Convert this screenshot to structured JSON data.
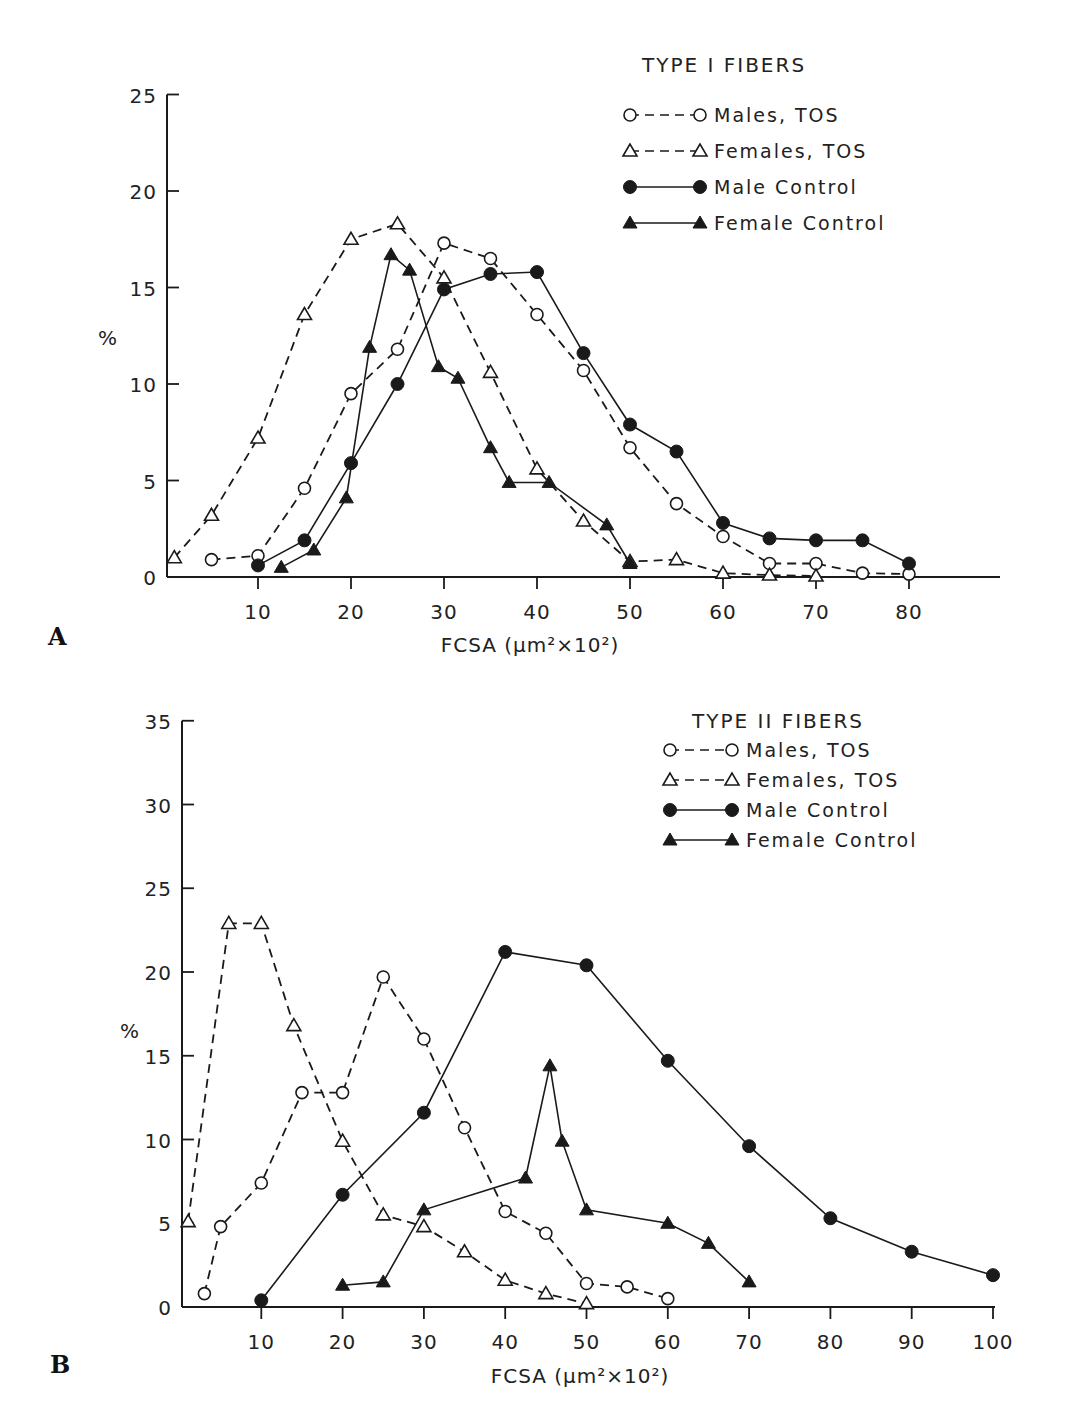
{
  "panels": [
    {
      "letter": "A"
    },
    {
      "letter": "B"
    }
  ],
  "chart_data": [
    {
      "type": "line",
      "panel": "A",
      "title": "TYPE I FIBERS",
      "xlabel": "FCSA (μm²×10²)",
      "ylabel": "%",
      "xlim": [
        0,
        90
      ],
      "ylim": [
        0,
        25
      ],
      "xticks": [
        10,
        20,
        30,
        40,
        50,
        60,
        70,
        80
      ],
      "yticks": [
        0,
        5,
        10,
        15,
        20,
        25
      ],
      "grid": false,
      "legend_position": "upper right",
      "series": [
        {
          "name": "Males, TOS",
          "marker": "open-circle",
          "line": "dashed",
          "x": [
            5,
            10,
            15,
            20,
            25,
            30,
            35,
            40,
            45,
            50,
            55,
            60,
            65,
            70,
            75,
            80
          ],
          "y": [
            0.9,
            1.1,
            4.6,
            9.5,
            11.8,
            17.3,
            16.5,
            13.6,
            10.7,
            6.7,
            3.8,
            2.1,
            0.7,
            0.7,
            0.2,
            0.15
          ]
        },
        {
          "name": "Females, TOS",
          "marker": "open-triangle",
          "line": "dashed",
          "x": [
            1,
            5,
            10,
            15,
            20,
            25,
            30,
            35,
            40,
            45,
            50,
            55,
            60,
            65,
            70
          ],
          "y": [
            1.0,
            3.2,
            7.2,
            13.6,
            17.5,
            18.3,
            15.5,
            10.6,
            5.6,
            2.9,
            0.8,
            0.9,
            0.2,
            0.1,
            0.05
          ]
        },
        {
          "name": "Male Control",
          "marker": "filled-circle",
          "line": "solid",
          "x": [
            10,
            15,
            20,
            25,
            30,
            35,
            40,
            45,
            50,
            55,
            60,
            65,
            70,
            75,
            80
          ],
          "y": [
            0.6,
            1.9,
            5.9,
            10.0,
            14.9,
            15.7,
            15.8,
            11.6,
            7.9,
            6.5,
            2.8,
            2.0,
            1.9,
            1.9,
            0.7
          ]
        },
        {
          "name": "Female Control",
          "marker": "filled-triangle",
          "line": "solid",
          "x": [
            12.5,
            16,
            19.5,
            22,
            24.3,
            26.3,
            29.4,
            31.5,
            35,
            37,
            41.3,
            47.5,
            50
          ],
          "y": [
            0.5,
            1.4,
            4.1,
            11.9,
            16.7,
            15.9,
            10.9,
            10.3,
            6.7,
            4.9,
            4.9,
            2.7,
            0.7
          ]
        }
      ]
    },
    {
      "type": "line",
      "panel": "B",
      "title": "TYPE II FIBERS",
      "xlabel": "FCSA (μm²×10²)",
      "ylabel": "%",
      "xlim": [
        0,
        100
      ],
      "ylim": [
        0,
        35
      ],
      "xticks": [
        10,
        20,
        30,
        40,
        50,
        60,
        70,
        80,
        90,
        100
      ],
      "yticks": [
        0,
        5,
        10,
        15,
        20,
        25,
        30,
        35
      ],
      "grid": false,
      "legend_position": "upper right",
      "series": [
        {
          "name": "Males, TOS",
          "marker": "open-circle",
          "line": "dashed",
          "x": [
            3,
            5,
            10,
            15,
            20,
            25,
            30,
            35,
            40,
            45,
            50,
            55,
            60
          ],
          "y": [
            0.8,
            4.8,
            7.4,
            12.8,
            12.8,
            19.7,
            16.0,
            10.7,
            5.7,
            4.4,
            1.4,
            1.2,
            0.5
          ]
        },
        {
          "name": "Females, TOS",
          "marker": "open-triangle",
          "line": "dashed",
          "x": [
            1,
            6,
            10,
            14,
            20,
            25,
            30,
            35,
            40,
            45,
            50
          ],
          "y": [
            5.1,
            22.9,
            22.9,
            16.8,
            9.9,
            5.5,
            4.8,
            3.3,
            1.6,
            0.8,
            0.2
          ]
        },
        {
          "name": "Male Control",
          "marker": "filled-circle",
          "line": "solid",
          "x": [
            10,
            20,
            30,
            40,
            50,
            60,
            70,
            80,
            90,
            100
          ],
          "y": [
            0.4,
            6.7,
            11.6,
            21.2,
            20.4,
            14.7,
            9.6,
            5.3,
            3.3,
            1.9
          ]
        },
        {
          "name": "Female Control",
          "marker": "filled-triangle",
          "line": "solid",
          "x": [
            20,
            25,
            30,
            42.5,
            45.5,
            47,
            50,
            60,
            65,
            70
          ],
          "y": [
            1.3,
            1.5,
            5.8,
            7.7,
            14.4,
            9.9,
            5.8,
            5.0,
            3.8,
            1.5
          ]
        }
      ]
    }
  ]
}
